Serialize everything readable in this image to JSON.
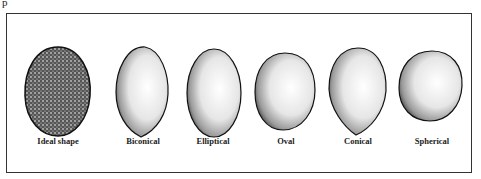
{
  "fragment_text": "p",
  "figure": {
    "shapes": [
      {
        "id": "ideal-shape",
        "label": "Ideal shape",
        "fill": "dense"
      },
      {
        "id": "biconical",
        "label": "Biconical",
        "fill": "stippled"
      },
      {
        "id": "elliptical",
        "label": "Elliptical",
        "fill": "stippled"
      },
      {
        "id": "oval",
        "label": "Oval",
        "fill": "stippled"
      },
      {
        "id": "conical",
        "label": "Conical",
        "fill": "stippled"
      },
      {
        "id": "spherical",
        "label": "Spherical",
        "fill": "stippled"
      }
    ]
  }
}
